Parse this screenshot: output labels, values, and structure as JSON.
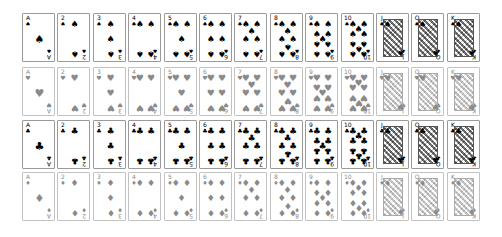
{
  "layout": {
    "origin_x": 22,
    "pitch_x": 35.4,
    "row_tops": [
      13,
      67,
      120,
      172
    ]
  },
  "ranks": [
    "A",
    "2",
    "3",
    "4",
    "5",
    "6",
    "7",
    "8",
    "9",
    "10",
    "J",
    "Q",
    "K"
  ],
  "suits": [
    {
      "name": "spades",
      "symbol": "♠",
      "color": "black"
    },
    {
      "name": "hearts",
      "symbol": "♥",
      "color": "red"
    },
    {
      "name": "clubs",
      "symbol": "♣",
      "color": "black"
    },
    {
      "name": "diamonds",
      "symbol": "♦",
      "color": "red"
    }
  ],
  "colors": {
    "black_pip": "#000000",
    "red_pip_rendered": "#8a8a8a",
    "black_border": "#9a9a9a",
    "red_border": "#c2c2c2"
  }
}
